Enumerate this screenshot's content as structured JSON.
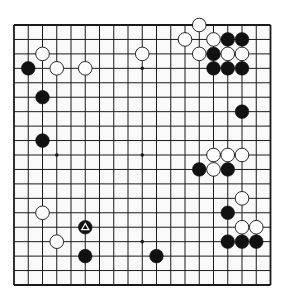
{
  "board": {
    "size": 19,
    "line_color": "#1a1a1a",
    "background": "#fafafa",
    "star_points": [
      [
        3,
        3
      ],
      [
        3,
        9
      ],
      [
        3,
        15
      ],
      [
        9,
        3
      ],
      [
        9,
        9
      ],
      [
        9,
        15
      ],
      [
        15,
        3
      ],
      [
        15,
        9
      ],
      [
        15,
        15
      ]
    ],
    "stones": [
      {
        "color": "white",
        "row": 0,
        "col": 13
      },
      {
        "color": "white",
        "row": 1,
        "col": 12
      },
      {
        "color": "white",
        "row": 1,
        "col": 14
      },
      {
        "color": "black",
        "row": 1,
        "col": 15
      },
      {
        "color": "black",
        "row": 1,
        "col": 16
      },
      {
        "color": "white",
        "row": 2,
        "col": 2
      },
      {
        "color": "white",
        "row": 2,
        "col": 9
      },
      {
        "color": "white",
        "row": 2,
        "col": 13
      },
      {
        "color": "black",
        "row": 2,
        "col": 14
      },
      {
        "color": "white",
        "row": 2,
        "col": 15
      },
      {
        "color": "white",
        "row": 2,
        "col": 16
      },
      {
        "color": "black",
        "row": 3,
        "col": 1
      },
      {
        "color": "white",
        "row": 3,
        "col": 3
      },
      {
        "color": "white",
        "row": 3,
        "col": 5
      },
      {
        "color": "black",
        "row": 3,
        "col": 14
      },
      {
        "color": "black",
        "row": 3,
        "col": 15
      },
      {
        "color": "black",
        "row": 3,
        "col": 16
      },
      {
        "color": "black",
        "row": 5,
        "col": 2
      },
      {
        "color": "black",
        "row": 6,
        "col": 16
      },
      {
        "color": "black",
        "row": 8,
        "col": 2
      },
      {
        "color": "white",
        "row": 9,
        "col": 14
      },
      {
        "color": "white",
        "row": 9,
        "col": 15
      },
      {
        "color": "white",
        "row": 9,
        "col": 16
      },
      {
        "color": "black",
        "row": 10,
        "col": 13
      },
      {
        "color": "white",
        "row": 10,
        "col": 14
      },
      {
        "color": "black",
        "row": 10,
        "col": 15
      },
      {
        "color": "white",
        "row": 12,
        "col": 16
      },
      {
        "color": "white",
        "row": 13,
        "col": 2
      },
      {
        "color": "black",
        "row": 13,
        "col": 15
      },
      {
        "color": "black",
        "row": 14,
        "col": 5,
        "marker": "triangle"
      },
      {
        "color": "white",
        "row": 14,
        "col": 16
      },
      {
        "color": "white",
        "row": 14,
        "col": 17
      },
      {
        "color": "white",
        "row": 15,
        "col": 3
      },
      {
        "color": "black",
        "row": 15,
        "col": 15
      },
      {
        "color": "black",
        "row": 15,
        "col": 16
      },
      {
        "color": "black",
        "row": 15,
        "col": 17
      },
      {
        "color": "black",
        "row": 16,
        "col": 5
      },
      {
        "color": "black",
        "row": 16,
        "col": 10
      }
    ]
  }
}
